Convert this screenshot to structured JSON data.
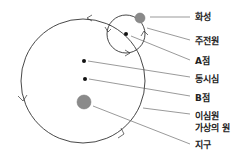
{
  "diagram": {
    "colors": {
      "line": "#333333",
      "planet": "#8a8a8a",
      "planet_stroke": "#777777",
      "point": "#111111",
      "leader": "#555555"
    },
    "deferent": {
      "cx": 83,
      "cy": 81,
      "r": 62
    },
    "epicycle": {
      "cx": 126,
      "cy": 34,
      "r": 19
    },
    "points": {
      "mars": {
        "cx": 140,
        "cy": 18,
        "r": 5
      },
      "a_point": {
        "cx": 126,
        "cy": 34,
        "r": 2
      },
      "equant": {
        "cx": 84,
        "cy": 61,
        "r": 2
      },
      "b_point": {
        "cx": 85,
        "cy": 79,
        "r": 2
      },
      "earth": {
        "cx": 84,
        "cy": 102,
        "r": 7
      }
    },
    "labels": [
      {
        "key": "mars",
        "text": "화성",
        "x": 195,
        "y": 15
      },
      {
        "key": "epicycle",
        "text": "주전원",
        "x": 195,
        "y": 36
      },
      {
        "key": "a_point",
        "text": "A점",
        "x": 195,
        "y": 57
      },
      {
        "key": "equant",
        "text": "동시심",
        "x": 195,
        "y": 74
      },
      {
        "key": "b_point",
        "text": "B점",
        "x": 195,
        "y": 93
      },
      {
        "key": "deferent",
        "text": "이심원",
        "x": 195,
        "y": 112
      },
      {
        "key": "deferent_sub",
        "text": "가상의 원",
        "x": 195,
        "y": 124
      },
      {
        "key": "earth",
        "text": "지구",
        "x": 195,
        "y": 141
      }
    ]
  }
}
